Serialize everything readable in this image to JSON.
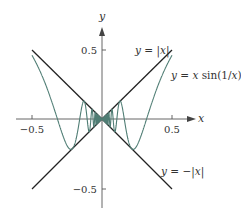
{
  "chart_data": {
    "type": "line",
    "title": "",
    "xlabel": "x",
    "ylabel": "y",
    "xlim": [
      -0.62,
      0.66
    ],
    "ylim": [
      -0.64,
      0.66
    ],
    "grid": false,
    "legend": "none (inline labels)",
    "x_ticks": [
      {
        "value": -0.5,
        "label": "−0.5"
      },
      {
        "value": 0.5,
        "label": "0.5"
      }
    ],
    "y_ticks": [
      {
        "value": 0.5,
        "label": "0.5"
      },
      {
        "value": -0.5,
        "label": "−0.5"
      }
    ],
    "series": [
      {
        "name": "y = |x|",
        "label": "y = |x|",
        "expression": "abs(x)",
        "domain": [
          -0.5,
          0.5
        ],
        "color": "#222222",
        "x": [
          -0.5,
          0,
          0.5
        ],
        "y": [
          0.5,
          0,
          0.5
        ]
      },
      {
        "name": "y = −|x|",
        "label": "y = −|x|",
        "expression": "-abs(x)",
        "domain": [
          -0.5,
          0.5
        ],
        "color": "#222222",
        "x": [
          -0.5,
          0,
          0.5
        ],
        "y": [
          -0.5,
          0,
          -0.5
        ]
      },
      {
        "name": "y = x sin(1/x)",
        "label": "y = x sin(1/x)",
        "expression": "x*sin(1/x)",
        "domain": [
          -0.5,
          0.5
        ],
        "color": "#4f7d74",
        "sample_points": {
          "x": [
            -0.5,
            -0.4,
            -0.3,
            -0.2,
            -0.1,
            0,
            0.1,
            0.2,
            0.3,
            0.4,
            0.5
          ],
          "y": [
            0.455,
            0.239,
            -0.057,
            -0.192,
            -0.054,
            0,
            -0.054,
            -0.192,
            -0.057,
            0.239,
            0.455
          ]
        }
      }
    ],
    "annotations": [
      {
        "text": "y = |x|",
        "near": [
          0.33,
          0.5
        ]
      },
      {
        "text": "y = x sin(1/x)",
        "near": [
          0.52,
          0.32
        ]
      },
      {
        "text": "y = −|x|",
        "near": [
          0.4,
          -0.38
        ]
      }
    ]
  },
  "axes": {
    "x_label": "x",
    "y_label": "y",
    "x_tick_labels": [
      "−0.5",
      "0.5"
    ],
    "y_tick_labels": [
      "0.5",
      "−0.5"
    ]
  },
  "labels": {
    "abs": "y = |x|",
    "xsin": "y = x sin(1/x)",
    "negabs": "y = −|x|"
  },
  "colors": {
    "line": "#222222",
    "curve": "#4f7d74",
    "axis": "#555555",
    "text": "#333333"
  }
}
